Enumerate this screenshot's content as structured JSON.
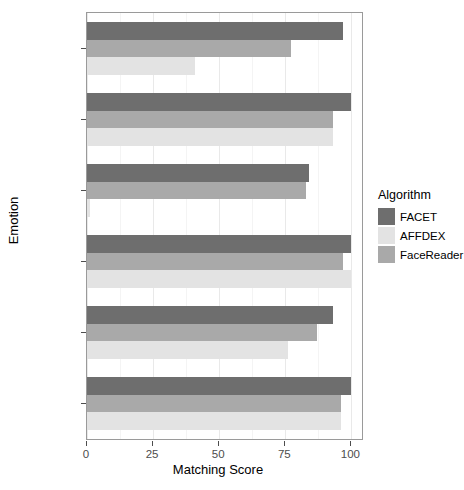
{
  "chart_data": {
    "type": "bar",
    "orientation": "horizontal",
    "title": "",
    "xlabel": "Matching Score",
    "ylabel": "Emotion",
    "categories": [
      "Anger",
      "Disgust",
      "Fear",
      "Happiness",
      "Sadness",
      "Surprise"
    ],
    "xlim": [
      0,
      104
    ],
    "xticks": [
      0,
      25,
      50,
      75,
      100
    ],
    "xtick_labels": [
      "0",
      "25",
      "50",
      "75",
      "100"
    ],
    "grid": true,
    "legend": {
      "title": "Algorithm",
      "position": "right",
      "entries": [
        {
          "name": "FACET",
          "color": "#6e6e6e"
        },
        {
          "name": "AFFDEX",
          "color": "#e3e3e3"
        },
        {
          "name": "FaceReader",
          "color": "#a9a9a9"
        }
      ]
    },
    "series": [
      {
        "name": "FACET",
        "color": "#6e6e6e",
        "values": [
          97,
          100,
          84,
          100,
          93,
          100
        ]
      },
      {
        "name": "FaceReader",
        "color": "#a9a9a9",
        "values": [
          77,
          93,
          83,
          97,
          87,
          96
        ]
      },
      {
        "name": "AFFDEX",
        "color": "#e3e3e3",
        "values": [
          41,
          93,
          1,
          100,
          76,
          96
        ]
      }
    ],
    "bar_draw_order": [
      "FACET",
      "FaceReader",
      "AFFDEX"
    ]
  },
  "axes": {
    "y_title": "Emotion",
    "x_title": "Matching Score"
  }
}
